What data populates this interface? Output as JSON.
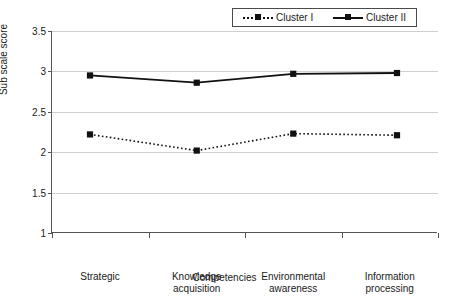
{
  "chart_data": {
    "type": "line",
    "title": "",
    "xlabel": "Competencies",
    "ylabel": "Sub scale score",
    "categories": [
      "Strategic",
      "Knowledge\nacquisition",
      "Environmental\nawareness",
      "Information\nprocessing"
    ],
    "ytick_labels": [
      "3.5",
      "3",
      "2.5",
      "2",
      "1.5",
      "1"
    ],
    "ytick_values": [
      3.5,
      3,
      2.5,
      2,
      1.5,
      1
    ],
    "ylim": [
      1,
      3.5
    ],
    "grid": true,
    "legend_position": "top-right",
    "series": [
      {
        "name": "Cluster I",
        "line_style": "dotted",
        "marker": "square",
        "color": "#111111",
        "values": [
          2.22,
          2.02,
          2.23,
          2.21
        ]
      },
      {
        "name": "Cluster II",
        "line_style": "solid",
        "marker": "square",
        "color": "#111111",
        "values": [
          2.95,
          2.86,
          2.97,
          2.98
        ]
      }
    ]
  },
  "legend": {
    "entries": [
      {
        "label": "Cluster I"
      },
      {
        "label": "Cluster II"
      }
    ]
  },
  "axes": {
    "y_title": "Sub scale score",
    "x_title": "Competencies"
  }
}
